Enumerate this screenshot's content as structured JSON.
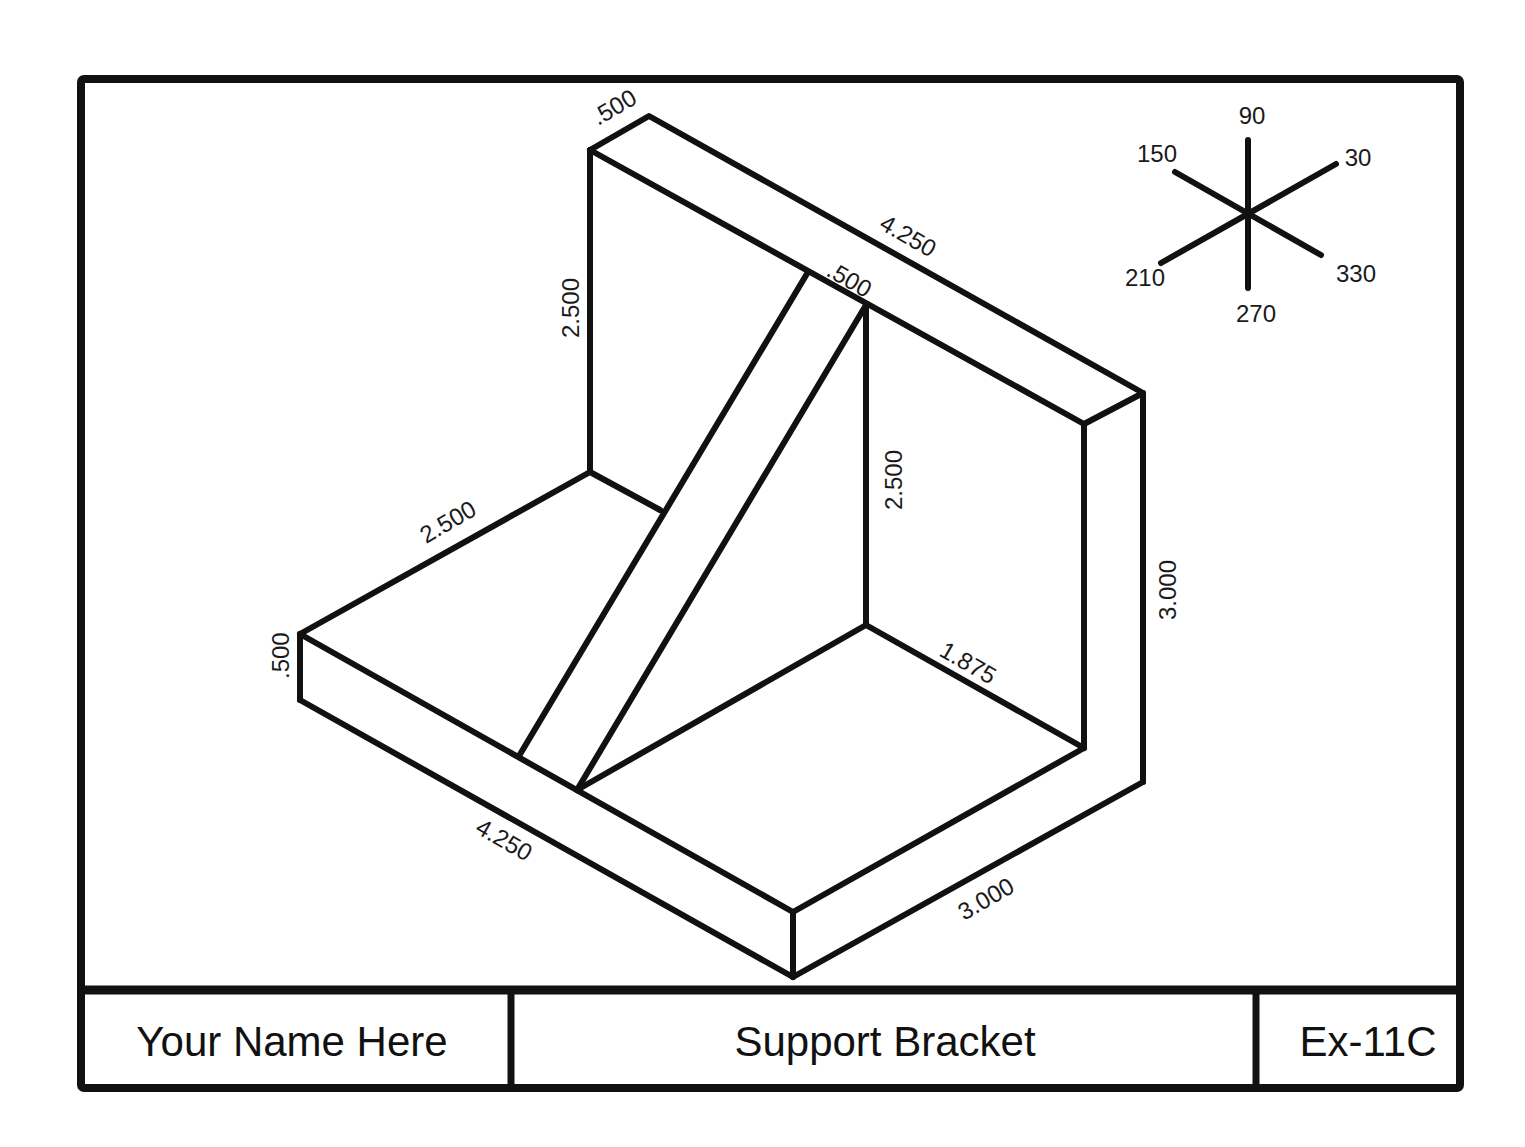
{
  "drawing": {
    "type": "isometric",
    "subject": "Support Bracket",
    "dimensions": {
      "back_top_thickness": ".500",
      "back_top_length": "4.250",
      "back_height_left": "2.500",
      "rib_thickness": ".500",
      "rib_height": "2.500",
      "base_depth_left": "2.500",
      "base_thickness": ".500",
      "back_height_total": "3.000",
      "rib_to_back_depth": "1.875",
      "base_length": "4.250",
      "base_depth": "3.000"
    },
    "axis_legend": {
      "labels": {
        "a90": "90",
        "a150": "150",
        "a30": "30",
        "a210": "210",
        "a330": "330",
        "a270": "270"
      }
    }
  },
  "title_block": {
    "name": "Your Name Here",
    "title": "Support Bracket",
    "number": "Ex-11C"
  }
}
